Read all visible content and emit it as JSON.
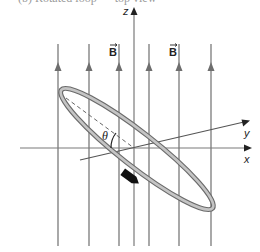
{
  "caption": "(b) Rotated loop — top view",
  "axes": {
    "x_label": "x",
    "y_label": "y",
    "z_label": "z"
  },
  "field": {
    "label": "B",
    "vector_marker": "→",
    "line_count": 6,
    "direction": "up",
    "line_color": "#6e6e6e"
  },
  "loop": {
    "angle_label": "θ",
    "ring_color": "#8a8a8a",
    "current_arrow_color": "#111111"
  }
}
